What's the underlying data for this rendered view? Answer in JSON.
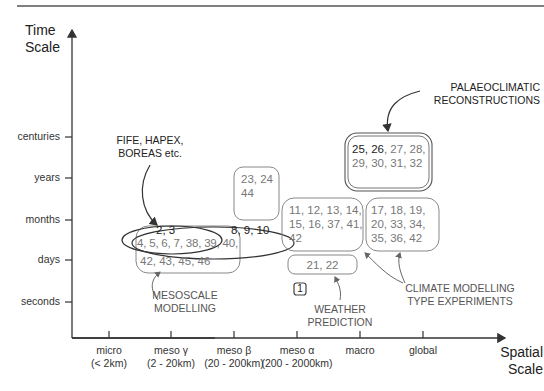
{
  "y_axis": {
    "title_line1": "Time",
    "title_line2": "Scale",
    "ticks": [
      "centuries",
      "years",
      "months",
      "days",
      "seconds"
    ]
  },
  "x_axis": {
    "title_line1": "Spatial",
    "title_line2": "Scale",
    "ticks": [
      {
        "name": "micro",
        "range": "(< 2km)"
      },
      {
        "name": "meso γ",
        "range": "(2 - 20km)"
      },
      {
        "name": "meso β",
        "range": "(20 - 200km)"
      },
      {
        "name": "meso α",
        "range": "(200 - 2000km)"
      },
      {
        "name": "macro",
        "range": ""
      },
      {
        "name": "global",
        "range": ""
      }
    ]
  },
  "groups": {
    "meso_gamma_top": "2, 3",
    "meso_gamma_mid": "4, 5, 6, 7, 38, 39, 40,",
    "meso_gamma_bottom": "42, 43, 45, 46",
    "meso_beta_ellipse": "8, 9, 10",
    "meso_beta_box_line1": "23, 24",
    "meso_beta_box_line2": "44",
    "meso_alpha_line1": "11, 12, 13, 14,",
    "meso_alpha_line2": "15, 16, 37, 41,",
    "meso_alpha_line3": "42",
    "meso_alpha_days": "21, 22",
    "seconds_box": "1",
    "macro_line1": "17, 18, 19,",
    "macro_line2": "20, 33, 34,",
    "macro_line3": "35, 36, 42",
    "palaeo_line1_bold": "25, 26",
    "palaeo_line1_rest": ", 27, 28,",
    "palaeo_line2": "29, 30, 31, 32"
  },
  "annotations": {
    "field_experiments_line1": "FIFE, HAPEX,",
    "field_experiments_line2": "BOREAS etc.",
    "palaeo_line1": "PALAEOCLIMATIC",
    "palaeo_line2": "RECONSTRUCTIONS",
    "mesoscale_line1": "MESOSCALE",
    "mesoscale_line2": "MODELLING",
    "weather_line1": "WEATHER",
    "weather_line2": "PREDICTION",
    "climate_line1": "CLIMATE MODELLING",
    "climate_line2": "TYPE EXPERIMENTS"
  },
  "colors": {
    "axis": "#333333",
    "box_stroke": "#777777",
    "text_dark": "#222222",
    "text_grey": "#777777"
  }
}
